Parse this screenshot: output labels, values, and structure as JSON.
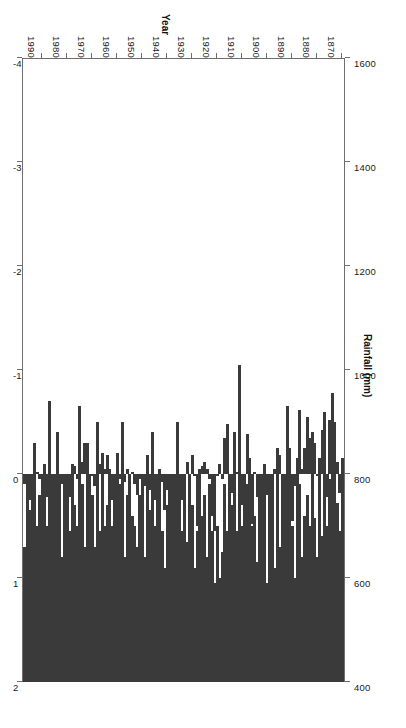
{
  "chart_data": {
    "type": "bar",
    "title": "",
    "orientation": "horizontal-bars-rotated-180",
    "xlabel": "Year",
    "x_axis": {
      "label": "Year",
      "ticks": [
        1870,
        1880,
        1890,
        1900,
        1910,
        1920,
        1930,
        1940,
        1950,
        1960,
        1970,
        1980,
        1990
      ],
      "range": [
        1869,
        1998
      ]
    },
    "y_axis_primary": {
      "label": "Rainfall (mm)",
      "ticks": [
        400,
        600,
        800,
        1000,
        1200,
        1400,
        1600
      ],
      "range": [
        400,
        1600
      ],
      "baseline": 400,
      "position": "top-in-image"
    },
    "y_axis_secondary": {
      "label": "Temperature anomaly (°C)",
      "ticks": [
        2,
        1,
        0,
        -1,
        -2,
        -3,
        -4
      ],
      "range": [
        -4,
        2
      ],
      "baseline": 0,
      "position": "bottom-in-image"
    },
    "grid": false,
    "legend": null,
    "bar_color": "#3a3a3a",
    "frame_color": "#6f6f6f",
    "series": [
      {
        "name": "Rainfall (mm)",
        "axis": "rainfall",
        "categories": [
          1870,
          1871,
          1872,
          1873,
          1874,
          1875,
          1876,
          1877,
          1878,
          1879,
          1880,
          1881,
          1882,
          1883,
          1884,
          1885,
          1886,
          1887,
          1888,
          1889,
          1890,
          1891,
          1892,
          1893,
          1894,
          1895,
          1896,
          1897,
          1898,
          1899,
          1900,
          1901,
          1902,
          1903,
          1904,
          1905,
          1906,
          1907,
          1908,
          1909,
          1910,
          1911,
          1912,
          1913,
          1914,
          1915,
          1916,
          1917,
          1918,
          1919,
          1920,
          1921,
          1922,
          1923,
          1924,
          1925,
          1926,
          1927,
          1928,
          1929,
          1930,
          1931,
          1932,
          1933,
          1934,
          1935,
          1936,
          1937,
          1938,
          1939,
          1940,
          1941,
          1942,
          1943,
          1944,
          1945,
          1946,
          1947,
          1948,
          1949,
          1950,
          1951,
          1952,
          1953,
          1954,
          1955,
          1956,
          1957,
          1958,
          1959,
          1960,
          1961,
          1962,
          1963,
          1964,
          1965,
          1966,
          1967,
          1968,
          1969,
          1970,
          1971,
          1972,
          1973,
          1974,
          1975,
          1976,
          1977,
          1978,
          1979,
          1980,
          1981,
          1982,
          1983,
          1984,
          1985,
          1986,
          1987,
          1988,
          1989,
          1990,
          1991,
          1992,
          1993,
          1994,
          1995,
          1996,
          1997
        ],
        "values": [
          810,
          690,
          745,
          900,
          955,
          790,
          700,
          860,
          680,
          830,
          640,
          715,
          880,
          700,
          760,
          720,
          640,
          780,
          830,
          600,
          700,
          850,
          930,
          770,
          700,
          660,
          840,
          620,
          760,
          700,
          590,
          820,
          760,
          660,
          630,
          720,
          700,
          830,
          780,
          640,
          700,
          1010,
          690,
          880,
          740,
          780,
          690,
          780,
          650,
          600,
          700,
          590,
          690,
          780,
          640,
          760,
          720,
          800,
          690,
          620,
          740,
          780,
          670,
          800,
          690,
          780,
          900,
          790,
          700,
          650,
          740,
          620,
          690,
          800,
          720,
          700,
          880,
          730,
          820,
          640,
          700,
          760,
          660,
          700,
          720,
          690,
          760,
          640,
          900,
          780,
          840,
          660,
          700,
          810,
          740,
          700,
          840,
          690,
          900,
          660,
          760,
          700,
          860,
          660,
          780,
          930,
          700,
          740,
          820,
          690,
          760,
          700,
          640,
          690,
          880,
          700,
          790,
          940,
          700,
          820,
          690,
          760,
          700,
          860,
          800,
          730,
          700,
          660
        ]
      },
      {
        "name": "Temperature anomaly (°C)",
        "axis": "temperature",
        "categories": [
          1870,
          1871,
          1872,
          1873,
          1874,
          1875,
          1876,
          1877,
          1878,
          1879,
          1880,
          1881,
          1882,
          1883,
          1884,
          1885,
          1886,
          1887,
          1888,
          1889,
          1890,
          1891,
          1892,
          1893,
          1894,
          1895,
          1896,
          1897,
          1898,
          1899,
          1900,
          1901,
          1902,
          1903,
          1904,
          1905,
          1906,
          1907,
          1908,
          1909,
          1910,
          1911,
          1912,
          1913,
          1914,
          1915,
          1916,
          1917,
          1918,
          1919,
          1920,
          1921,
          1922,
          1923,
          1924,
          1925,
          1926,
          1927,
          1928,
          1929,
          1930,
          1931,
          1932,
          1933,
          1934,
          1935,
          1936,
          1937,
          1938,
          1939,
          1940,
          1941,
          1942,
          1943,
          1944,
          1945,
          1946,
          1947,
          1948,
          1949,
          1950,
          1951,
          1952,
          1953,
          1954,
          1955,
          1956,
          1957,
          1958,
          1959,
          1960,
          1961,
          1962,
          1963,
          1964,
          1965,
          1966,
          1967,
          1968,
          1969,
          1970,
          1971,
          1972,
          1973,
          1974,
          1975,
          1976,
          1977,
          1978,
          1979,
          1980,
          1981,
          1982,
          1983,
          1984,
          1985,
          1986,
          1987,
          1988,
          1989,
          1990,
          1991,
          1992,
          1993,
          1994,
          1995,
          1996,
          1997
        ],
        "values": [
          -0.15,
          0.18,
          -0.12,
          -0.05,
          -0.28,
          -0.52,
          0.22,
          -0.6,
          -0.42,
          -0.1,
          0.02,
          -0.3,
          0.2,
          -0.35,
          -0.55,
          -0.25,
          -0.05,
          -0.62,
          -0.08,
          0.12,
          0.45,
          0.02,
          -0.05,
          0.3,
          0.55,
          -0.18,
          -0.25,
          -0.05,
          0.62,
          0.75,
          0.2,
          -0.02,
          0.35,
          1.7,
          0.22,
          -0.02,
          0.48,
          1.18,
          -0.38,
          1.02,
          0.3,
          -0.05,
          -0.02,
          0.08,
          0.18,
          1.22,
          -0.48,
          -0.35,
          0.05,
          -0.1,
          0.02,
          0.55,
          0.4,
          0.05,
          -0.05,
          -0.12,
          -0.08,
          -0.05,
          0.5,
          0.02,
          -0.18,
          0.68,
          -0.12,
          0.05,
          0.25,
          0.1,
          0.28,
          0.05,
          0.7,
          1.08,
          0.15,
          0.35,
          0.08,
          -0.05,
          0.5,
          0.25,
          0.05,
          0.15,
          -0.18,
          0.12,
          0.8,
          0.05,
          0.2,
          0.1,
          -0.02,
          0.68,
          -0.05,
          0.08,
          -0.12,
          0.05,
          0.3,
          0.85,
          0.25,
          0.02,
          -0.18,
          -0.05,
          0.22,
          -0.1,
          0.42,
          0.12,
          0.02,
          0.72,
          0.32,
          -0.3,
          -0.12,
          0.6,
          0.05,
          -0.08,
          0.25,
          0.22,
          0.42,
          0.65,
          0.1,
          1.48,
          0.28,
          0.82,
          0.18,
          -0.05,
          0.22,
          0.4,
          1.12,
          0.05,
          -0.02,
          0.48,
          0.38,
          0.25,
          0.55,
          0.1,
          -0.05
        ]
      }
    ]
  },
  "labels": {
    "rainfall_title": "Rainfall (mm)",
    "temperature_title": "Temperature anomaly (°C)",
    "year_title": "Year"
  }
}
